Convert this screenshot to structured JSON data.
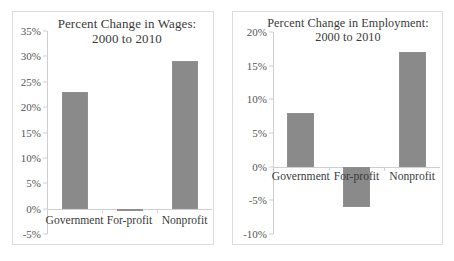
{
  "chart_data": [
    {
      "type": "bar",
      "id": "wages",
      "title": "Percent Change in Wages:",
      "subtitle": "2000 to 2010",
      "categories": [
        "Government",
        "For-profit",
        "Nonprofit"
      ],
      "values": [
        23,
        -0.5,
        29
      ],
      "value_labels": [
        "23%",
        "-0.5%",
        "29%"
      ],
      "xlabel": "",
      "ylabel": "",
      "ylim": [
        -5,
        35
      ],
      "yticks": [
        35,
        30,
        25,
        20,
        15,
        10,
        5,
        0,
        -5
      ],
      "ytick_labels": [
        "35%",
        "30%",
        "25%",
        "20%",
        "15%",
        "10%",
        "5%",
        "0%",
        "-5%"
      ],
      "grid": false,
      "legend": false,
      "bar_color": "#8a8a8a",
      "axis_color": "#cfcfcf"
    },
    {
      "type": "bar",
      "id": "employment",
      "title": "Percent Change in Employment:",
      "subtitle": "2000 to 2010",
      "categories": [
        "Government",
        "For-profit",
        "Nonprofit"
      ],
      "values": [
        8,
        -6,
        17
      ],
      "value_labels": [
        "8%",
        "-6%",
        "17%"
      ],
      "xlabel": "",
      "ylabel": "",
      "ylim": [
        -10,
        20
      ],
      "yticks": [
        20,
        15,
        10,
        5,
        0,
        -5,
        -10
      ],
      "ytick_labels": [
        "20%",
        "15%",
        "10%",
        "5%",
        "0%",
        "-5%",
        "-10%"
      ],
      "grid": false,
      "legend": false,
      "bar_color": "#8a8a8a",
      "axis_color": "#cfcfcf"
    }
  ],
  "figure": {
    "background": "#ffffff",
    "panel_border": "#dcdcdc"
  }
}
